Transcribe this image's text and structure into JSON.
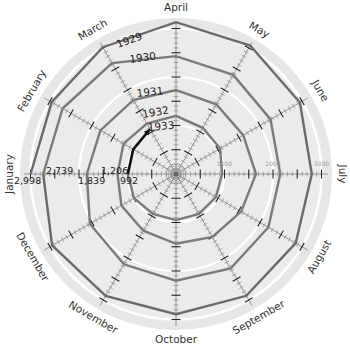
{
  "chart_data": {
    "type": "radar-spiral",
    "title": "",
    "center": [
      176,
      174
    ],
    "px_per_unit": 0.0485,
    "axis_max": 3200,
    "scale_rings": [
      1000,
      2000,
      3000
    ],
    "scale_ring_labels": [
      "1000",
      "2000",
      "3000"
    ],
    "months": [
      "January",
      "February",
      "March",
      "April",
      "May",
      "June",
      "July",
      "August",
      "September",
      "October",
      "November",
      "December"
    ],
    "series": [
      {
        "name": "1929",
        "color": "#6a6a6a",
        "values": [
          2998,
          2960,
          3020,
          3130,
          3060,
          2950,
          2800,
          2850,
          2900,
          2890,
          2900,
          2950
        ]
      },
      {
        "name": "1930",
        "color": "#7a7a7a",
        "values": [
          2739,
          2700,
          2640,
          2430,
          2360,
          2250,
          2150,
          2200,
          2250,
          2200,
          2150,
          2050
        ]
      },
      {
        "name": "1931",
        "color": "#7a7a7a",
        "values": [
          1839,
          1800,
          1760,
          1730,
          1660,
          1600,
          1650,
          1550,
          1500,
          1440,
          1350,
          1300
        ]
      },
      {
        "name": "1932",
        "color": "#7a7a7a",
        "values": [
          1206,
          1250,
          1200,
          1200,
          1100,
          1050,
          950,
          950,
          950,
          950,
          950,
          1000
        ]
      },
      {
        "name": "1933",
        "color": "#111111",
        "values": [
          992,
          1020,
          1070
        ]
      }
    ],
    "value_labels": [
      {
        "text": "2,998",
        "x": 14,
        "y": 184
      },
      {
        "text": "2,739",
        "x": 46,
        "y": 174
      },
      {
        "text": "1,839",
        "x": 78,
        "y": 184
      },
      {
        "text": "1,206",
        "x": 101,
        "y": 174
      },
      {
        "text": "992",
        "x": 120,
        "y": 184
      }
    ],
    "year_labels": [
      {
        "text": "1929",
        "x": 118,
        "y": 48,
        "rotate": -20
      },
      {
        "text": "1930",
        "x": 130,
        "y": 63,
        "rotate": -8
      },
      {
        "text": "1931",
        "x": 137,
        "y": 97,
        "rotate": -6
      },
      {
        "text": "1932",
        "x": 143,
        "y": 118,
        "rotate": -10
      },
      {
        "text": "1933",
        "x": 148,
        "y": 131,
        "rotate": -5
      }
    ],
    "legend": null,
    "grid": true
  }
}
